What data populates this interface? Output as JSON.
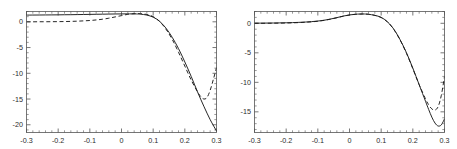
{
  "figure": {
    "panel_count": 2,
    "background_color": "#ffffff",
    "frame_color": "#555555",
    "curve_color": "#1a1a1a"
  },
  "chart_data": [
    {
      "type": "line",
      "title": "",
      "subtitle": "",
      "xlabel": "",
      "ylabel": "",
      "panel": "left",
      "xlim": [
        -0.3,
        0.3
      ],
      "ylim": [
        -21.5,
        2.0
      ],
      "xticks": [
        -0.3,
        -0.2,
        -0.1,
        0,
        0.1,
        0.2,
        0.3
      ],
      "xtick_labels": [
        "-0.3",
        "-0.2",
        "-0.1",
        "0",
        "0.1",
        "0.2",
        "0.3"
      ],
      "yticks": [
        0,
        -5,
        -10,
        -15,
        -20
      ],
      "ytick_labels": [
        "0",
        "-5",
        "-10",
        "-15",
        "-20"
      ],
      "grid": false,
      "legend": "none",
      "frame": "box",
      "series": [
        {
          "name": "solid",
          "style": "solid",
          "x": [
            -0.3,
            -0.28,
            -0.26,
            -0.24,
            -0.22,
            -0.2,
            -0.18,
            -0.16,
            -0.14,
            -0.12,
            -0.1,
            -0.08,
            -0.06,
            -0.04,
            -0.02,
            0.0,
            0.02,
            0.04,
            0.05,
            0.06,
            0.08,
            0.1,
            0.12,
            0.14,
            0.16,
            0.18,
            0.2,
            0.22,
            0.24,
            0.26,
            0.28,
            0.3
          ],
          "values": [
            1.3,
            1.31,
            1.32,
            1.33,
            1.34,
            1.35,
            1.37,
            1.38,
            1.4,
            1.42,
            1.44,
            1.46,
            1.48,
            1.5,
            1.52,
            1.53,
            1.54,
            1.53,
            1.52,
            1.48,
            1.3,
            0.9,
            0.1,
            -1.2,
            -3.0,
            -5.2,
            -7.8,
            -10.6,
            -13.6,
            -16.4,
            -19.0,
            -21.2
          ]
        },
        {
          "name": "dashed",
          "style": "dashed",
          "x": [
            -0.3,
            -0.28,
            -0.26,
            -0.24,
            -0.22,
            -0.2,
            -0.18,
            -0.16,
            -0.14,
            -0.12,
            -0.1,
            -0.08,
            -0.06,
            -0.04,
            -0.02,
            0.0,
            0.02,
            0.04,
            0.05,
            0.06,
            0.08,
            0.1,
            0.12,
            0.14,
            0.16,
            0.18,
            0.2,
            0.22,
            0.24,
            0.25,
            0.26,
            0.27,
            0.28,
            0.29,
            0.3
          ],
          "values": [
            0.0,
            0.0,
            0.01,
            0.01,
            0.02,
            0.03,
            0.05,
            0.08,
            0.12,
            0.18,
            0.25,
            0.36,
            0.5,
            0.7,
            0.95,
            1.2,
            1.45,
            1.58,
            1.6,
            1.58,
            1.42,
            1.0,
            0.1,
            -1.4,
            -3.4,
            -5.9,
            -8.6,
            -11.3,
            -13.6,
            -14.5,
            -15.0,
            -14.7,
            -13.3,
            -11.2,
            -8.9
          ]
        }
      ]
    },
    {
      "type": "line",
      "title": "",
      "subtitle": "",
      "xlabel": "",
      "ylabel": "",
      "panel": "right",
      "xlim": [
        -0.3,
        0.3
      ],
      "ylim": [
        -18.5,
        2.0
      ],
      "xticks": [
        -0.3,
        -0.2,
        -0.1,
        0,
        0.1,
        0.2,
        0.3
      ],
      "xtick_labels": [
        "-0.3",
        "-0.2",
        "-0.1",
        "0",
        "0.1",
        "0.2",
        "0.3"
      ],
      "yticks": [
        0,
        -5,
        -10,
        -15
      ],
      "ytick_labels": [
        "0",
        "-5",
        "-10",
        "-15"
      ],
      "grid": false,
      "legend": "none",
      "frame": "box",
      "series": [
        {
          "name": "solid",
          "style": "solid",
          "x": [
            -0.3,
            -0.28,
            -0.26,
            -0.24,
            -0.22,
            -0.2,
            -0.18,
            -0.16,
            -0.14,
            -0.12,
            -0.1,
            -0.08,
            -0.06,
            -0.04,
            -0.02,
            0.0,
            0.02,
            0.04,
            0.05,
            0.06,
            0.08,
            0.1,
            0.12,
            0.14,
            0.16,
            0.18,
            0.2,
            0.22,
            0.24,
            0.25,
            0.26,
            0.27,
            0.28,
            0.29,
            0.3
          ],
          "values": [
            0.02,
            0.03,
            0.04,
            0.05,
            0.07,
            0.09,
            0.12,
            0.16,
            0.21,
            0.28,
            0.38,
            0.52,
            0.72,
            0.96,
            1.22,
            1.42,
            1.54,
            1.58,
            1.57,
            1.53,
            1.35,
            1.0,
            0.25,
            -1.0,
            -2.8,
            -5.0,
            -7.6,
            -10.4,
            -13.2,
            -14.6,
            -15.9,
            -16.9,
            -17.4,
            -17.2,
            -16.2
          ]
        },
        {
          "name": "dashed",
          "style": "dashed",
          "x": [
            -0.3,
            -0.28,
            -0.26,
            -0.24,
            -0.22,
            -0.2,
            -0.18,
            -0.16,
            -0.14,
            -0.12,
            -0.1,
            -0.08,
            -0.06,
            -0.04,
            -0.02,
            0.0,
            0.02,
            0.04,
            0.05,
            0.06,
            0.08,
            0.1,
            0.12,
            0.14,
            0.16,
            0.18,
            0.2,
            0.22,
            0.24,
            0.25,
            0.26,
            0.27,
            0.28,
            0.29,
            0.3
          ],
          "values": [
            0.0,
            0.0,
            0.01,
            0.02,
            0.03,
            0.05,
            0.08,
            0.12,
            0.18,
            0.25,
            0.35,
            0.5,
            0.7,
            0.94,
            1.2,
            1.4,
            1.53,
            1.57,
            1.56,
            1.52,
            1.34,
            0.98,
            0.22,
            -1.05,
            -2.85,
            -5.1,
            -7.7,
            -10.4,
            -12.8,
            -13.8,
            -14.5,
            -14.7,
            -14.1,
            -12.2,
            -9.0
          ]
        }
      ]
    }
  ]
}
